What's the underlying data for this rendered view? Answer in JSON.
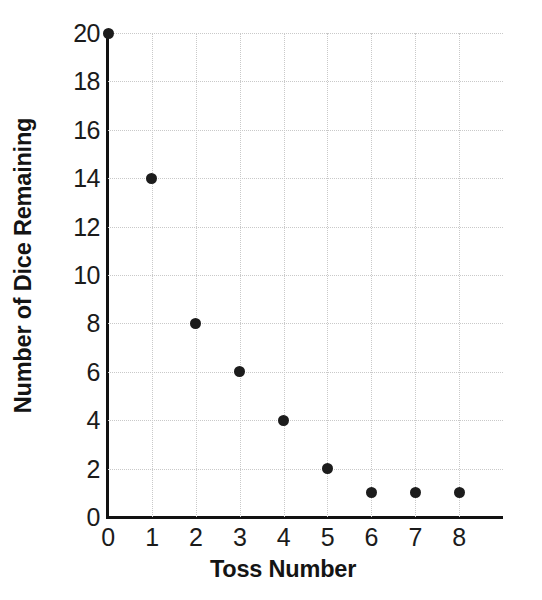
{
  "chart_data": {
    "type": "scatter",
    "title": "",
    "xlabel": "Toss Number",
    "ylabel": "Number of Dice Remaining",
    "x": [
      0,
      1,
      2,
      3,
      4,
      5,
      6,
      7,
      8
    ],
    "values": [
      20,
      14,
      8,
      6,
      4,
      2,
      1,
      1,
      1
    ],
    "points": [
      {
        "x": 0,
        "y": 20
      },
      {
        "x": 1,
        "y": 14
      },
      {
        "x": 2,
        "y": 8
      },
      {
        "x": 3,
        "y": 6
      },
      {
        "x": 4,
        "y": 4
      },
      {
        "x": 5,
        "y": 2
      },
      {
        "x": 6,
        "y": 1
      },
      {
        "x": 7,
        "y": 1
      },
      {
        "x": 8,
        "y": 1
      }
    ],
    "xlim": [
      0,
      8.2
    ],
    "ylim": [
      0,
      20
    ],
    "xticks": [
      0,
      1,
      2,
      3,
      4,
      5,
      6,
      7,
      8
    ],
    "yticks": [
      0,
      2,
      4,
      6,
      8,
      10,
      12,
      14,
      16,
      18,
      20
    ],
    "xtick_labels": [
      "0",
      "1",
      "2",
      "3",
      "4",
      "5",
      "6",
      "7",
      "8"
    ],
    "ytick_labels": [
      "0",
      "2",
      "4",
      "6",
      "8",
      "10",
      "12",
      "14",
      "16",
      "18",
      "20"
    ],
    "grid": true,
    "grid_style": "dotted",
    "grid_color": "#c9c9c9",
    "legend": null,
    "marker_color": "#1c1c1c",
    "axis_color": "#111111",
    "background_color": "#ffffff"
  }
}
